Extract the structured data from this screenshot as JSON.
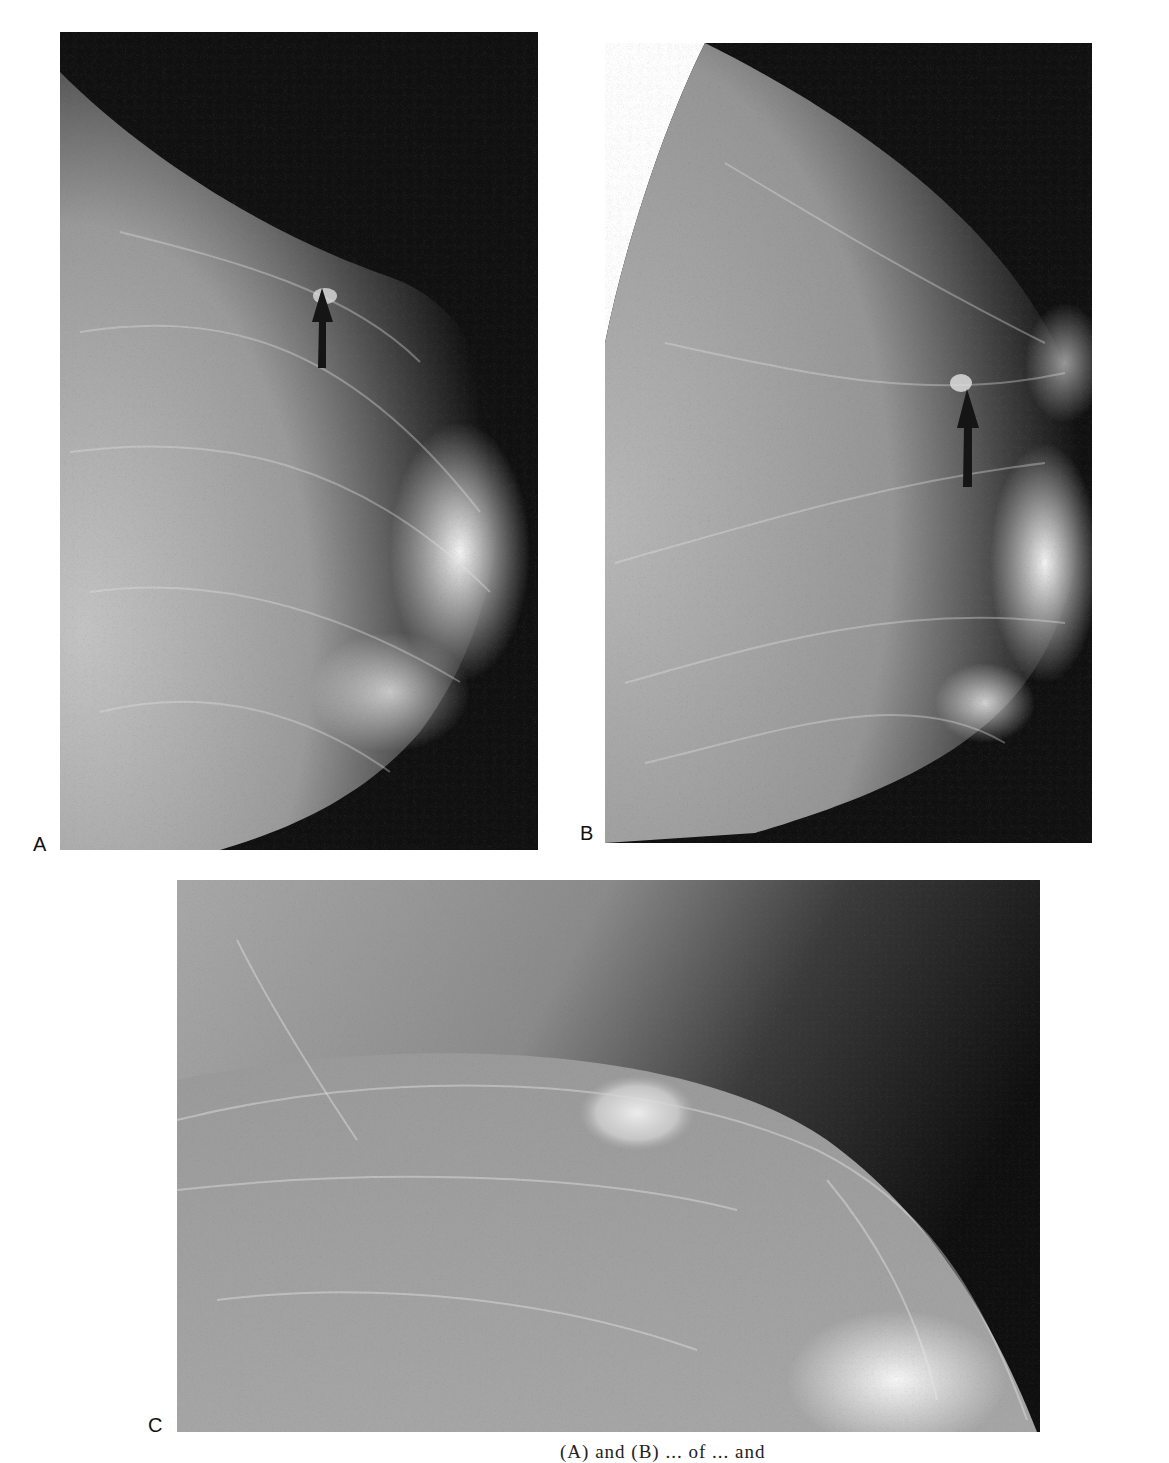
{
  "figure": {
    "panels": [
      {
        "id": "A",
        "label": "A",
        "view": "mammogram-mediolateral",
        "has_arrow": true
      },
      {
        "id": "B",
        "label": "B",
        "view": "mammogram-craniocaudal",
        "has_arrow": true
      },
      {
        "id": "C",
        "label": "C",
        "view": "magnified-spot-view",
        "has_arrow": false
      }
    ],
    "caption_partial": "(A) and (B) ... of ... and"
  },
  "colors": {
    "background": "#ffffff",
    "film_dark": "#0e0e0e",
    "tissue_gray": "#8a8a8a",
    "dense_white": "#f4f4f4",
    "arrow": "#151515"
  }
}
